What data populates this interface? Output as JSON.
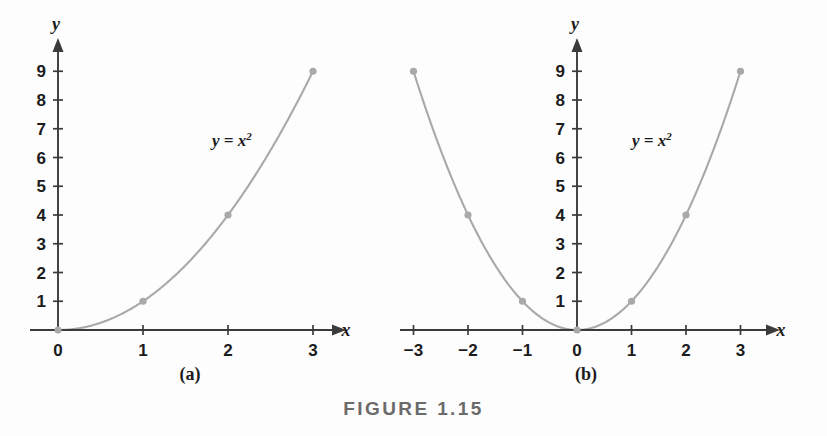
{
  "figure": {
    "caption": "FIGURE 1.15",
    "panel_a_label": "(a)",
    "panel_b_label": "(b)"
  },
  "chart_data": [
    {
      "type": "line",
      "id": "panel-a",
      "title": "(a)",
      "equation_label": "y = x2",
      "equation_label_base": "y = x",
      "equation_label_exponent": "2",
      "function": "y = x^2",
      "xlabel": "x",
      "ylabel": "y",
      "xlim": [
        0,
        3.3
      ],
      "ylim": [
        0,
        9.8
      ],
      "x_ticks": [
        0,
        1,
        2,
        3
      ],
      "x_tick_labels": [
        "0",
        "1",
        "2",
        "3"
      ],
      "y_ticks": [
        1,
        2,
        3,
        4,
        5,
        6,
        7,
        8,
        9
      ],
      "y_tick_labels": [
        "1",
        "2",
        "3",
        "4",
        "5",
        "6",
        "7",
        "8",
        "9"
      ],
      "grid": false,
      "legend": "none",
      "points": [
        {
          "x": 0,
          "y": 0
        },
        {
          "x": 1,
          "y": 1
        },
        {
          "x": 2,
          "y": 4
        },
        {
          "x": 3,
          "y": 9
        }
      ],
      "domain_drawn": [
        0,
        3
      ],
      "curve_color": "#a9a9a9",
      "axis_color": "#3b3b3b"
    },
    {
      "type": "line",
      "id": "panel-b",
      "title": "(b)",
      "equation_label": "y = x2",
      "equation_label_base": "y = x",
      "equation_label_exponent": "2",
      "function": "y = x^2",
      "xlabel": "x",
      "ylabel": "y",
      "xlim": [
        -3.4,
        3.3
      ],
      "ylim": [
        0,
        9.8
      ],
      "x_ticks": [
        -3,
        -2,
        -1,
        0,
        1,
        2,
        3
      ],
      "x_tick_labels": [
        "−3",
        "−2",
        "−1",
        "0",
        "1",
        "2",
        "3"
      ],
      "y_ticks": [
        1,
        2,
        3,
        4,
        5,
        6,
        7,
        8,
        9
      ],
      "y_tick_labels": [
        "1",
        "2",
        "3",
        "4",
        "5",
        "6",
        "7",
        "8",
        "9"
      ],
      "grid": false,
      "legend": "none",
      "points": [
        {
          "x": -3,
          "y": 9
        },
        {
          "x": -2,
          "y": 4
        },
        {
          "x": -1,
          "y": 1
        },
        {
          "x": 0,
          "y": 0
        },
        {
          "x": 1,
          "y": 1
        },
        {
          "x": 2,
          "y": 4
        },
        {
          "x": 3,
          "y": 9
        }
      ],
      "domain_drawn": [
        -3,
        3
      ],
      "curve_color": "#a9a9a9",
      "axis_color": "#3b3b3b"
    }
  ]
}
